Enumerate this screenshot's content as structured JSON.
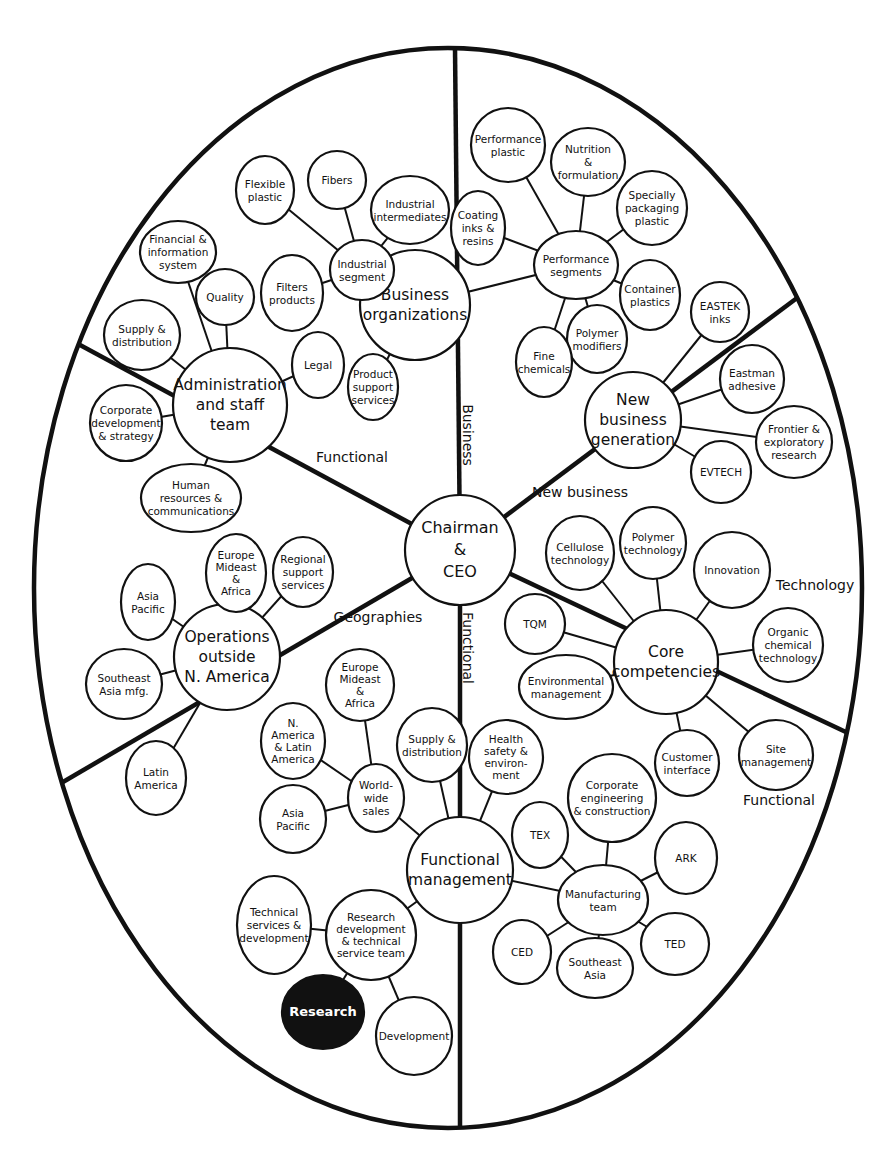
{
  "diagram": {
    "colors": {
      "line": "#111111",
      "background": "#ffffff",
      "highlight_fill": "#111111",
      "highlight_text": "#ffffff"
    },
    "frame": {
      "cx": 448,
      "cy": 588,
      "rx": 414,
      "ry": 540
    },
    "hub": {
      "id": "ceo",
      "label": [
        "Chairman",
        "&",
        "CEO"
      ],
      "x": 460,
      "y": 550,
      "r": 55
    },
    "sector_labels": [
      {
        "id": "business",
        "text": "Business",
        "x": 463,
        "y": 435,
        "rotate": 90
      },
      {
        "id": "functional-upper-left",
        "text": "Functional",
        "x": 352,
        "y": 462,
        "rotate": 0
      },
      {
        "id": "new-business",
        "text": "New business",
        "x": 580,
        "y": 497,
        "rotate": 0
      },
      {
        "id": "geographies",
        "text": "Geographies",
        "x": 378,
        "y": 622,
        "rotate": 0
      },
      {
        "id": "technology",
        "text": "Technology",
        "x": 815,
        "y": 590,
        "rotate": 0
      },
      {
        "id": "functional-lower",
        "text": "Functional",
        "x": 463,
        "y": 648,
        "rotate": 90
      },
      {
        "id": "functional-lower-right",
        "text": "Functional",
        "x": 779,
        "y": 805,
        "rotate": 0
      }
    ],
    "dividers": [
      {
        "to": [
          455,
          48
        ]
      },
      {
        "to": [
          460,
          1128
        ]
      },
      {
        "to": [
          80,
          345
        ]
      },
      {
        "to": [
          63,
          782
        ]
      },
      {
        "to": [
          797,
          298
        ]
      },
      {
        "to": [
          848,
          733
        ]
      }
    ],
    "groups": [
      {
        "id": "business-organizations",
        "label": [
          "Business",
          "organizations"
        ],
        "x": 415,
        "y": 305,
        "r": 55,
        "size": "big",
        "children": [
          {
            "id": "industrial-segment",
            "label": [
              "Industrial",
              "segment"
            ],
            "x": 362,
            "y": 270,
            "rx": 32,
            "ry": 30,
            "children": [
              {
                "id": "flexible-plastic",
                "label": [
                  "Flexible",
                  "plastic"
                ],
                "x": 265,
                "y": 190,
                "rx": 29,
                "ry": 34
              },
              {
                "id": "fibers",
                "label": [
                  "Fibers"
                ],
                "x": 337,
                "y": 180,
                "rx": 29,
                "ry": 29
              },
              {
                "id": "industrial-intermediates",
                "label": [
                  "Industrial",
                  "intermediates"
                ],
                "x": 410,
                "y": 210,
                "rx": 39,
                "ry": 34
              },
              {
                "id": "filters-products",
                "label": [
                  "Filters",
                  "products"
                ],
                "x": 292,
                "y": 293,
                "rx": 31,
                "ry": 38
              }
            ]
          },
          {
            "id": "product-support-services",
            "label": [
              "Product",
              "support",
              "services"
            ],
            "x": 373,
            "y": 387,
            "rx": 25,
            "ry": 33
          },
          {
            "id": "performance-segments",
            "label": [
              "Performance",
              "segments"
            ],
            "x": 576,
            "y": 265,
            "rx": 42,
            "ry": 34,
            "children": [
              {
                "id": "performance-plastic",
                "label": [
                  "Performance",
                  "plastic"
                ],
                "x": 508,
                "y": 145,
                "rx": 37,
                "ry": 37
              },
              {
                "id": "nutrition-formulation",
                "label": [
                  "Nutrition",
                  "&",
                  "formulation"
                ],
                "x": 588,
                "y": 162,
                "rx": 37,
                "ry": 34
              },
              {
                "id": "specially-packaging-plastic",
                "label": [
                  "Specially",
                  "packaging",
                  "plastic"
                ],
                "x": 652,
                "y": 208,
                "rx": 35,
                "ry": 37
              },
              {
                "id": "coating-inks-resins",
                "label": [
                  "Coating",
                  "inks &",
                  "resins"
                ],
                "x": 478,
                "y": 228,
                "rx": 27,
                "ry": 37
              },
              {
                "id": "container-plastics",
                "label": [
                  "Container",
                  "plastics"
                ],
                "x": 650,
                "y": 295,
                "rx": 30,
                "ry": 35
              },
              {
                "id": "polymer-modifiers",
                "label": [
                  "Polymer",
                  "modifiers"
                ],
                "x": 597,
                "y": 339,
                "rx": 30,
                "ry": 34
              },
              {
                "id": "fine-chemicals",
                "label": [
                  "Fine",
                  "chemicals"
                ],
                "x": 544,
                "y": 362,
                "rx": 28,
                "ry": 35
              }
            ]
          }
        ]
      },
      {
        "id": "administration-staff-team",
        "label": [
          "Administration",
          "and staff",
          "team"
        ],
        "x": 230,
        "y": 405,
        "r": 57,
        "size": "big",
        "children": [
          {
            "id": "supply-distribution-admin",
            "label": [
              "Supply &",
              "distribution"
            ],
            "x": 142,
            "y": 335,
            "rx": 38,
            "ry": 35
          },
          {
            "id": "financial-information-system",
            "label": [
              "Financial &",
              "information",
              "system"
            ],
            "x": 178,
            "y": 252,
            "rx": 38,
            "ry": 31
          },
          {
            "id": "quality",
            "label": [
              "Quality"
            ],
            "x": 225,
            "y": 297,
            "rx": 29,
            "ry": 28
          },
          {
            "id": "legal",
            "label": [
              "Legal"
            ],
            "x": 318,
            "y": 365,
            "rx": 26,
            "ry": 33
          },
          {
            "id": "corporate-development-strategy",
            "label": [
              "Corporate",
              "development",
              "& strategy"
            ],
            "x": 126,
            "y": 423,
            "rx": 36,
            "ry": 38
          },
          {
            "id": "human-resources-communications",
            "label": [
              "Human",
              "resources &",
              "communications"
            ],
            "x": 191,
            "y": 498,
            "rx": 50,
            "ry": 34
          }
        ]
      },
      {
        "id": "new-business-generation",
        "label": [
          "New",
          "business",
          "generation"
        ],
        "x": 633,
        "y": 420,
        "r": 48,
        "size": "big",
        "children": [
          {
            "id": "eastek-inks",
            "label": [
              "EASTEK",
              "inks"
            ],
            "x": 720,
            "y": 312,
            "rx": 29,
            "ry": 30
          },
          {
            "id": "eastman-adhesive",
            "label": [
              "Eastman",
              "adhesive"
            ],
            "x": 752,
            "y": 379,
            "rx": 32,
            "ry": 34
          },
          {
            "id": "frontier-exploratory-research",
            "label": [
              "Frontier &",
              "exploratory",
              "research"
            ],
            "x": 794,
            "y": 442,
            "rx": 38,
            "ry": 36
          },
          {
            "id": "evtech",
            "label": [
              "EVTECH"
            ],
            "x": 721,
            "y": 472,
            "rx": 30,
            "ry": 31
          }
        ]
      },
      {
        "id": "operations-outside-na",
        "label": [
          "Operations",
          "outside",
          "N. America"
        ],
        "x": 227,
        "y": 657,
        "r": 53,
        "size": "big",
        "children": [
          {
            "id": "asia-pacific-ops",
            "label": [
              "Asia",
              "Pacific"
            ],
            "x": 148,
            "y": 602,
            "rx": 27,
            "ry": 38
          },
          {
            "id": "southeast-asia-mfg",
            "label": [
              "Southeast",
              "Asia mfg."
            ],
            "x": 124,
            "y": 684,
            "rx": 38,
            "ry": 35
          },
          {
            "id": "latin-america",
            "label": [
              "Latin",
              "America"
            ],
            "x": 156,
            "y": 778,
            "rx": 30,
            "ry": 37
          },
          {
            "id": "europe-mideast-africa-ops",
            "label": [
              "Europe",
              "Mideast",
              "&",
              "Africa"
            ],
            "x": 236,
            "y": 573,
            "rx": 30,
            "ry": 39
          },
          {
            "id": "regional-support-services",
            "label": [
              "Regional",
              "support",
              "services"
            ],
            "x": 303,
            "y": 572,
            "rx": 30,
            "ry": 35
          }
        ]
      },
      {
        "id": "core-competencies",
        "label": [
          "Core",
          "competencies"
        ],
        "x": 666,
        "y": 662,
        "r": 52,
        "size": "big",
        "children": [
          {
            "id": "cellulose-technology",
            "label": [
              "Cellulose",
              "technology"
            ],
            "x": 580,
            "y": 553,
            "rx": 34,
            "ry": 37
          },
          {
            "id": "polymer-technology",
            "label": [
              "Polymer",
              "technology"
            ],
            "x": 653,
            "y": 543,
            "rx": 33,
            "ry": 36
          },
          {
            "id": "innovation",
            "label": [
              "Innovation"
            ],
            "x": 732,
            "y": 570,
            "rx": 38,
            "ry": 38
          },
          {
            "id": "organic-chemical-technology",
            "label": [
              "Organic",
              "chemical",
              "technology"
            ],
            "x": 788,
            "y": 645,
            "rx": 35,
            "ry": 37
          },
          {
            "id": "tqm",
            "label": [
              "TQM"
            ],
            "x": 535,
            "y": 624,
            "rx": 30,
            "ry": 30
          },
          {
            "id": "environmental-management",
            "label": [
              "Environmental",
              "management"
            ],
            "x": 566,
            "y": 687,
            "rx": 47,
            "ry": 32
          },
          {
            "id": "customer-interface",
            "label": [
              "Customer",
              "interface"
            ],
            "x": 687,
            "y": 763,
            "rx": 32,
            "ry": 33
          },
          {
            "id": "site-management",
            "label": [
              "Site",
              "management"
            ],
            "x": 776,
            "y": 755,
            "rx": 37,
            "ry": 35
          }
        ]
      },
      {
        "id": "functional-management",
        "label": [
          "Functional",
          "management"
        ],
        "x": 460,
        "y": 870,
        "r": 53,
        "size": "big",
        "children": [
          {
            "id": "world-wide-sales",
            "label": [
              "World-",
              "wide",
              "sales"
            ],
            "x": 376,
            "y": 798,
            "rx": 28,
            "ry": 34,
            "children": [
              {
                "id": "na-latin-america",
                "label": [
                  "N.",
                  "America",
                  "& Latin",
                  "America"
                ],
                "x": 293,
                "y": 741,
                "rx": 32,
                "ry": 38
              },
              {
                "id": "europe-mideast-africa-sales",
                "label": [
                  "Europe",
                  "Mideast",
                  "&",
                  "Africa"
                ],
                "x": 360,
                "y": 685,
                "rx": 34,
                "ry": 36
              },
              {
                "id": "asia-pacific-sales",
                "label": [
                  "Asia",
                  "Pacific"
                ],
                "x": 293,
                "y": 819,
                "rx": 33,
                "ry": 34
              }
            ]
          },
          {
            "id": "supply-distribution-func",
            "label": [
              "Supply &",
              "distribution"
            ],
            "x": 432,
            "y": 745,
            "rx": 35,
            "ry": 37
          },
          {
            "id": "health-safety-environment",
            "label": [
              "Health",
              "safety &",
              "environ-",
              "ment"
            ],
            "x": 506,
            "y": 757,
            "rx": 37,
            "ry": 37
          },
          {
            "id": "manufacturing-team",
            "label": [
              "Manufacturing",
              "team"
            ],
            "x": 603,
            "y": 900,
            "rx": 45,
            "ry": 35,
            "children": [
              {
                "id": "tex",
                "label": [
                  "TEX"
                ],
                "x": 540,
                "y": 835,
                "rx": 28,
                "ry": 33
              },
              {
                "id": "corporate-engineering-construction",
                "label": [
                  "Corporate",
                  "engineering",
                  "& construction"
                ],
                "x": 612,
                "y": 798,
                "rx": 44,
                "ry": 44
              },
              {
                "id": "ark",
                "label": [
                  "ARK"
                ],
                "x": 686,
                "y": 858,
                "rx": 31,
                "ry": 36
              },
              {
                "id": "ted",
                "label": [
                  "TED"
                ],
                "x": 675,
                "y": 944,
                "rx": 34,
                "ry": 31
              },
              {
                "id": "southeast-asia-mfg-team",
                "label": [
                  "Southeast",
                  "Asia"
                ],
                "x": 595,
                "y": 968,
                "rx": 38,
                "ry": 30
              },
              {
                "id": "ced",
                "label": [
                  "CED"
                ],
                "x": 522,
                "y": 952,
                "rx": 29,
                "ry": 32
              }
            ]
          },
          {
            "id": "rd-technical-service-team",
            "label": [
              "Research",
              "development",
              "& technical",
              "service team"
            ],
            "x": 371,
            "y": 935,
            "rx": 45,
            "ry": 45,
            "children": [
              {
                "id": "technical-services-development",
                "label": [
                  "Technical",
                  "services &",
                  "development"
                ],
                "x": 274,
                "y": 925,
                "rx": 37,
                "ry": 49
              },
              {
                "id": "research",
                "label": [
                  "Research"
                ],
                "x": 323,
                "y": 1012,
                "rx": 41,
                "ry": 37,
                "highlight": true
              },
              {
                "id": "development",
                "label": [
                  "Development"
                ],
                "x": 414,
                "y": 1036,
                "rx": 38,
                "ry": 39
              }
            ]
          }
        ]
      }
    ]
  }
}
